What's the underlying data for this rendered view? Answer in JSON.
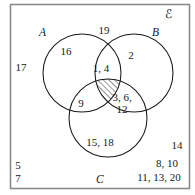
{
  "diagram": {
    "type": "venn-3-set",
    "universal_set_label": "ℰ",
    "sets": [
      {
        "id": "A",
        "label": "A"
      },
      {
        "id": "B",
        "label": "B"
      },
      {
        "id": "C",
        "label": "C"
      }
    ],
    "regions": [
      {
        "id": "A-only",
        "label": "16",
        "x": 66,
        "y": 52
      },
      {
        "id": "B-only",
        "label": "2",
        "x": 131,
        "y": 56
      },
      {
        "id": "C-only",
        "label": "15, 18",
        "x": 100,
        "y": 143
      },
      {
        "id": "A-and-B",
        "label": "1, 4",
        "x": 101,
        "y": 69
      },
      {
        "id": "A-and-C",
        "label": "9",
        "x": 81,
        "y": 104
      },
      {
        "id": "B-and-C",
        "label": "3, 6,\n12",
        "x": 121,
        "y": 103
      },
      {
        "id": "A-and-B-and-C",
        "label": "",
        "x": 103,
        "y": 92
      },
      {
        "id": "outside-top",
        "label": "19",
        "x": 104,
        "y": 31
      },
      {
        "id": "outside-left",
        "label": "17",
        "x": 21,
        "y": 68
      },
      {
        "id": "outside-bottom-left-1",
        "label": "5",
        "x": 17,
        "y": 166
      },
      {
        "id": "outside-bottom-left-2",
        "label": "7",
        "x": 17,
        "y": 179
      },
      {
        "id": "outside-right",
        "label": "14",
        "x": 177,
        "y": 146
      },
      {
        "id": "outside-bottom-right-1",
        "label": "8, 10",
        "x": 167,
        "y": 164
      },
      {
        "id": "outside-bottom-right-2",
        "label": "11, 13, 20",
        "x": 159,
        "y": 178
      }
    ],
    "shaded_region": "A-and-B-and-C",
    "shading_style": "diagonal-hatch",
    "colors": {
      "stroke": "#19181c",
      "box_stroke": "#8a8a8a",
      "text": "#19181c",
      "background": "#ffffff"
    }
  }
}
